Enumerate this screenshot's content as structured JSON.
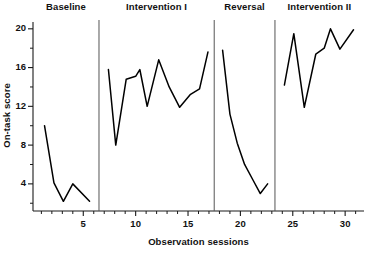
{
  "chart_data": {
    "type": "line",
    "title": "",
    "xlabel": "Observation sessions",
    "ylabel": "On-task score",
    "xlim": [
      0.2,
      31.8
    ],
    "ylim": [
      1.2,
      20.6
    ],
    "grid": false,
    "legend_position": "none",
    "y_ticks_major": [
      4,
      8,
      12,
      16,
      20
    ],
    "y_tick_labels": [
      "4",
      "8",
      "12",
      "16",
      "20"
    ],
    "y_ticks_minor": [
      2,
      6,
      10,
      14,
      18
    ],
    "x_ticks_major": [
      5,
      10,
      15,
      20,
      25,
      30
    ],
    "x_tick_labels": [
      "5",
      "10",
      "15",
      "20",
      "25",
      "30"
    ],
    "x_ticks_minor": [
      1,
      2,
      3,
      4,
      6,
      7,
      8,
      9,
      11,
      12,
      13,
      14,
      16,
      17,
      18,
      19,
      21,
      22,
      23,
      24,
      26,
      27,
      28,
      29,
      31
    ],
    "phase_dividers": [
      6.5,
      17.5,
      23.3
    ],
    "line_color": "#000000",
    "series": [
      {
        "name": "Baseline",
        "x": [
          1.3,
          2.2,
          3.1,
          4.0,
          5.6
        ],
        "values": [
          10.0,
          4.1,
          2.2,
          4.0,
          2.2
        ]
      },
      {
        "name": "Intervention I",
        "x": [
          7.4,
          8.1,
          9.1,
          10.0,
          10.4,
          11.1,
          12.2,
          13.2,
          14.2,
          15.2,
          16.1,
          16.9
        ],
        "values": [
          15.8,
          8.0,
          14.8,
          15.1,
          15.8,
          12.0,
          16.8,
          14.0,
          11.9,
          13.2,
          13.8,
          17.6
        ]
      },
      {
        "name": "Reversal",
        "x": [
          18.3,
          19.0,
          19.7,
          20.4,
          21.2,
          21.9,
          22.6
        ],
        "values": [
          17.8,
          11.2,
          8.2,
          6.0,
          4.4,
          3.0,
          4.0
        ]
      },
      {
        "name": "Intervention II",
        "x": [
          24.2,
          25.1,
          26.1,
          27.2,
          28.0,
          28.6,
          29.5,
          30.8
        ],
        "values": [
          14.2,
          19.5,
          11.9,
          17.4,
          18.0,
          20.0,
          17.9,
          19.9
        ]
      }
    ]
  },
  "phases": [
    {
      "label": "Baseline"
    },
    {
      "label": "Intervention I"
    },
    {
      "label": "Reversal"
    },
    {
      "label": "Intervention II"
    }
  ]
}
